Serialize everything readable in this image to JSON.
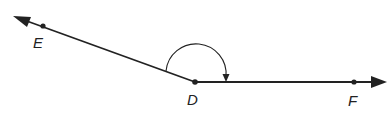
{
  "diagram": {
    "type": "angle",
    "vertex": {
      "label": "D",
      "x": 195,
      "y": 82
    },
    "points": [
      {
        "label": "E",
        "x": 43,
        "y": 26
      },
      {
        "label": "D",
        "x": 195,
        "y": 82
      },
      {
        "label": "F",
        "x": 354,
        "y": 82
      }
    ],
    "rays": [
      {
        "name": "ray-DE",
        "from": "D",
        "through": "E",
        "arrow_tip": {
          "x": 14,
          "y": 16
        }
      },
      {
        "name": "ray-DF",
        "from": "D",
        "through": "F",
        "arrow_tip": {
          "x": 386,
          "y": 82
        }
      }
    ],
    "angle_arc": {
      "from_ray": "DE",
      "to_ray": "DF",
      "arrowhead_at": "DF"
    },
    "colors": {
      "line": "#222222",
      "background": "#ffffff"
    }
  },
  "labels": {
    "E": "E",
    "D": "D",
    "F": "F"
  }
}
